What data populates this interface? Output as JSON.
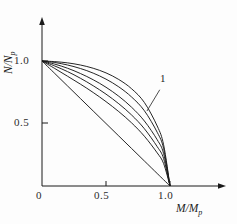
{
  "figure": {
    "background_color": "#fdfdfd",
    "line_color": "#1a1a1a"
  },
  "chart_data": {
    "type": "line",
    "title": "",
    "subtitle": "",
    "xlabel": "M/Mp",
    "ylabel": "N/Np",
    "xlabel_text": "M/M",
    "xlabel_sub": "p",
    "ylabel_text": "N/N",
    "ylabel_sub": "p",
    "xlim": [
      0,
      1.15
    ],
    "ylim": [
      0,
      1.15
    ],
    "xticks": [
      0,
      0.5,
      1.0
    ],
    "xticklabels": [
      "0",
      "0.5",
      "1.0"
    ],
    "yticks": [
      0.5,
      1.0
    ],
    "yticklabels": [
      "0.5",
      "1.0"
    ],
    "grid": false,
    "legend": "none",
    "annotations": [
      {
        "text": "1",
        "x": 0.94,
        "y": 0.82,
        "leader_from": [
          0.92,
          0.77
        ],
        "leader_to": [
          0.82,
          0.6
        ]
      }
    ],
    "series": [
      {
        "name": "curve-1",
        "x": [
          0,
          0.1,
          0.2,
          0.3,
          0.4,
          0.5,
          0.6,
          0.7,
          0.8,
          0.9,
          0.95,
          1.0
        ],
        "y": [
          1.0,
          0.995,
          0.985,
          0.968,
          0.942,
          0.905,
          0.852,
          0.778,
          0.668,
          0.48,
          0.33,
          0.0
        ]
      },
      {
        "name": "curve-2",
        "x": [
          0,
          0.1,
          0.2,
          0.3,
          0.4,
          0.5,
          0.6,
          0.7,
          0.8,
          0.9,
          0.95,
          1.0
        ],
        "y": [
          1.0,
          0.988,
          0.968,
          0.94,
          0.903,
          0.855,
          0.793,
          0.712,
          0.602,
          0.43,
          0.3,
          0.0
        ]
      },
      {
        "name": "curve-3",
        "x": [
          0,
          0.1,
          0.2,
          0.3,
          0.4,
          0.5,
          0.6,
          0.7,
          0.8,
          0.9,
          0.95,
          1.0
        ],
        "y": [
          1.0,
          0.975,
          0.942,
          0.9,
          0.85,
          0.79,
          0.718,
          0.63,
          0.52,
          0.37,
          0.26,
          0.0
        ]
      },
      {
        "name": "curve-4",
        "x": [
          0,
          0.1,
          0.2,
          0.3,
          0.4,
          0.5,
          0.6,
          0.7,
          0.8,
          0.9,
          0.95,
          1.0
        ],
        "y": [
          1.0,
          0.96,
          0.915,
          0.862,
          0.802,
          0.735,
          0.658,
          0.568,
          0.458,
          0.315,
          0.22,
          0.0
        ]
      },
      {
        "name": "curve-5",
        "x": [
          0,
          0.1,
          0.2,
          0.3,
          0.4,
          0.5,
          0.6,
          0.7,
          0.8,
          0.9,
          0.95,
          1.0
        ],
        "y": [
          1.0,
          0.94,
          0.878,
          0.815,
          0.748,
          0.675,
          0.595,
          0.505,
          0.398,
          0.265,
          0.18,
          0.0
        ]
      },
      {
        "name": "curve-6",
        "x": [
          0,
          0.1,
          0.2,
          0.3,
          0.4,
          0.5,
          0.6,
          0.7,
          0.8,
          0.9,
          0.95,
          1.0
        ],
        "y": [
          1.0,
          0.9,
          0.8,
          0.7,
          0.6,
          0.5,
          0.4,
          0.3,
          0.2,
          0.1,
          0.05,
          0.0
        ]
      }
    ]
  }
}
